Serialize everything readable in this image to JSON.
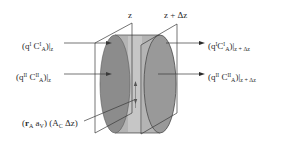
{
  "diagram": {
    "plane_labels": {
      "left": "z",
      "right": "z + Δz"
    },
    "inflow_labels": {
      "phase1": {
        "prefix": "(q",
        "q_sup": "I",
        "c": " C",
        "c_sup": "I",
        "c_sub": "A",
        "suffix": ")|",
        "eval": "z"
      },
      "phase2": {
        "prefix": "(q",
        "q_sup": "II",
        "c": " C",
        "c_sup": "II",
        "c_sub": "A",
        "suffix": ")|",
        "eval": "z"
      }
    },
    "outflow_labels": {
      "phase1": {
        "prefix": "(q",
        "q_sup": "I",
        "c": "C",
        "c_sup": "I",
        "c_sub": "A",
        "suffix": ")|",
        "eval": "z + Δz"
      },
      "phase2": {
        "prefix": "(q",
        "q_sup": "II",
        "c": " C",
        "c_sup": "II",
        "c_sub": "A",
        "suffix": ")|",
        "eval": "z + Δz"
      }
    },
    "reaction_label": {
      "r": "r",
      "r_sub": "A",
      "a": " a",
      "a_sub": "V",
      "area": ") (A",
      "area_sub": "C",
      "dz": " Δz)"
    },
    "colors": {
      "line": "#3a3a3a",
      "cylinder_body": "#b4b4b4",
      "cylinder_end": "#8c8c8c",
      "cylinder_edge": "#5a5a5a",
      "inner_band": "#c8c8c8"
    }
  }
}
